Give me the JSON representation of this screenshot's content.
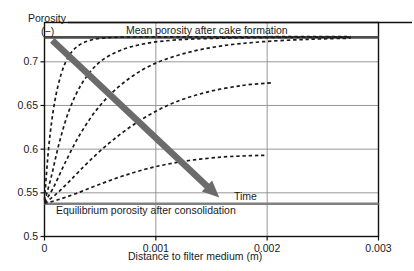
{
  "chart_data": {
    "type": "line",
    "title": "",
    "xlabel": "Distance to filter medium (m)",
    "ylabel": "Porosity",
    "ylabel_unit": "(−)",
    "xlim": [
      0,
      0.003
    ],
    "ylim": [
      0.5,
      0.745
    ],
    "xticks": [
      0,
      0.001,
      0.002,
      0.003
    ],
    "xticklabels": [
      "0",
      "0.001",
      "0.002",
      "0.003"
    ],
    "yticks": [
      0.5,
      0.55,
      0.6,
      0.65,
      0.7
    ],
    "yticklabels": [
      "0.5",
      "0.55",
      "0.6",
      "0.65",
      "0.7"
    ],
    "grid": true,
    "legend": "none",
    "annotations": [
      {
        "name": "mean-porosity-line-label",
        "text": "Mean porosity after cake formation",
        "x": 0.00105,
        "y": 0.737
      },
      {
        "name": "equilibrium-porosity-line-label",
        "text": "Equilibrium porosity after consolidation",
        "x": 0.00045,
        "y": 0.522
      },
      {
        "name": "time-arrow-label",
        "text": "Time",
        "x": 0.00215,
        "y": 0.548
      }
    ],
    "reference_lines": [
      {
        "name": "mean-porosity-after-cake-formation",
        "y": 0.728,
        "style": "solid",
        "color": "#4d4d4d"
      },
      {
        "name": "equilibrium-porosity-after-consolidation",
        "y": 0.5375,
        "style": "solid",
        "color": "#808080"
      }
    ],
    "time_arrow": {
      "name": "time-direction-arrow",
      "from": [
        7e-05,
        0.7245
      ],
      "to": [
        0.00157,
        0.5445
      ],
      "color": "#6b6b6b"
    },
    "series": [
      {
        "name": "consolidation-profile-1",
        "label": "t1 (longest consolidation)",
        "style": "dashed",
        "color": "#1a1a1a",
        "x": [
          0.0,
          4e-05,
          9e-05,
          0.00015,
          0.00022,
          0.00031,
          0.00042,
          0.00056,
          0.00073,
          0.00095,
          0.00122,
          0.00155,
          0.00195,
          0.0024,
          0.00275
        ],
        "y": [
          0.542,
          0.605,
          0.653,
          0.686,
          0.707,
          0.719,
          0.725,
          0.7275,
          0.7283,
          0.7285,
          0.7286,
          0.7287,
          0.7287,
          0.7288,
          0.7288
        ]
      },
      {
        "name": "consolidation-profile-2",
        "label": "t2",
        "style": "dashed",
        "color": "#1a1a1a",
        "x": [
          0.0,
          6e-05,
          0.00013,
          0.00022,
          0.00034,
          0.00049,
          0.00068,
          0.00091,
          0.00118,
          0.0015,
          0.00187,
          0.0023,
          0.00275
        ],
        "y": [
          0.54,
          0.568,
          0.606,
          0.644,
          0.676,
          0.699,
          0.713,
          0.721,
          0.725,
          0.7268,
          0.7276,
          0.7281,
          0.7284
        ]
      },
      {
        "name": "consolidation-profile-3",
        "label": "t3",
        "style": "dashed",
        "color": "#1a1a1a",
        "x": [
          0.0,
          8e-05,
          0.00018,
          0.00031,
          0.00048,
          0.00069,
          0.00094,
          0.00124,
          0.00158,
          0.00196,
          0.00238,
          0.00275
        ],
        "y": [
          0.539,
          0.556,
          0.583,
          0.615,
          0.647,
          0.674,
          0.695,
          0.709,
          0.718,
          0.723,
          0.7258,
          0.727
        ]
      },
      {
        "name": "consolidation-profile-4",
        "label": "t4",
        "style": "dashed",
        "color": "#1a1a1a",
        "x": [
          0.0,
          0.0001,
          0.00023,
          0.0004,
          0.00061,
          0.00086,
          0.00114,
          0.00145,
          0.00178,
          0.00205
        ],
        "y": [
          0.5385,
          0.548,
          0.564,
          0.586,
          0.61,
          0.633,
          0.652,
          0.665,
          0.673,
          0.676
        ]
      },
      {
        "name": "consolidation-profile-5",
        "label": "t5 (shortest consolidation)",
        "style": "dashed",
        "color": "#1a1a1a",
        "x": [
          0.0,
          0.00012,
          0.00028,
          0.00048,
          0.00072,
          0.001,
          0.0013,
          0.0016,
          0.00185,
          0.002
        ],
        "y": [
          0.538,
          0.542,
          0.549,
          0.559,
          0.57,
          0.58,
          0.587,
          0.591,
          0.5925,
          0.593
        ]
      }
    ]
  },
  "axes": {
    "y_title": "Porosity",
    "y_unit": "(−)",
    "x_title": "Distance to filter medium (m)"
  }
}
